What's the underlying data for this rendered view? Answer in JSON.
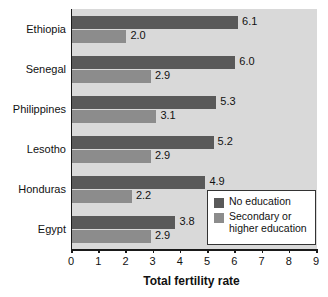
{
  "chart_data": {
    "type": "bar",
    "orientation": "horizontal",
    "title": "",
    "xlabel": "Total fertility rate",
    "ylabel": "",
    "xlim": [
      0,
      9
    ],
    "xticks": [
      "0",
      "1",
      "2",
      "3",
      "4",
      "5",
      "6",
      "7",
      "8",
      "9"
    ],
    "grid": false,
    "legend_position": "bottom-right",
    "categories": [
      "Ethiopia",
      "Senegal",
      "Philippines",
      "Lesotho",
      "Honduras",
      "Egypt"
    ],
    "series": [
      {
        "name": "No education",
        "color": "#595959",
        "values": [
          6.1,
          6.0,
          5.3,
          5.2,
          4.9,
          3.8
        ],
        "labels": [
          "6.1",
          "6.0",
          "5.3",
          "5.2",
          "4.9",
          "3.8"
        ]
      },
      {
        "name": "Secondary or higher education",
        "color": "#8c8c8c",
        "values": [
          2.0,
          2.9,
          3.1,
          2.9,
          2.2,
          2.9
        ],
        "labels": [
          "2.0",
          "2.9",
          "3.1",
          "2.9",
          "2.2",
          "2.9"
        ]
      }
    ]
  },
  "legend": {
    "entries": [
      {
        "label": "No education",
        "label_line2": "",
        "color": "#595959"
      },
      {
        "label": "Secondary or",
        "label_line2": "higher education",
        "color": "#8c8c8c"
      }
    ]
  },
  "colors": {
    "plot_background": "#d9d9d9",
    "axis": "#1a1a1a",
    "text": "#111111",
    "legend_background": "#ffffff",
    "legend_border": "#333333"
  }
}
